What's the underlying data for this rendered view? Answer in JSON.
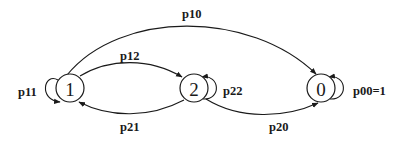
{
  "diagram": {
    "type": "state-transition",
    "nodes": [
      {
        "id": "1",
        "label": "1"
      },
      {
        "id": "2",
        "label": "2"
      },
      {
        "id": "0",
        "label": "0"
      }
    ],
    "edges": [
      {
        "from": "1",
        "to": "1",
        "label": "p11"
      },
      {
        "from": "1",
        "to": "2",
        "label": "p12"
      },
      {
        "from": "2",
        "to": "1",
        "label": "p21"
      },
      {
        "from": "2",
        "to": "2",
        "label": "p22"
      },
      {
        "from": "1",
        "to": "0",
        "label": "p10"
      },
      {
        "from": "2",
        "to": "0",
        "label": "p20"
      },
      {
        "from": "0",
        "to": "0",
        "label": "p00=1"
      }
    ]
  }
}
